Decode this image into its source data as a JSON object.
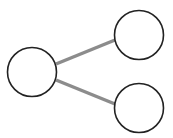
{
  "diagram": {
    "type": "tree",
    "colors": {
      "background": "#ffffff",
      "node_fill": "#ffffff",
      "node_stroke": "#222222",
      "edge": "#8c8c8c"
    },
    "nodes": [
      {
        "id": "root",
        "cx": 32,
        "cy": 72,
        "r": 24.5,
        "label": ""
      },
      {
        "id": "child-top",
        "cx": 139,
        "cy": 35,
        "r": 24.5,
        "label": ""
      },
      {
        "id": "child-bottom",
        "cx": 139,
        "cy": 108,
        "r": 24.5,
        "label": ""
      }
    ],
    "edges": [
      {
        "from": "root",
        "to": "child-top",
        "x1": 56,
        "y1": 64,
        "x2": 115,
        "y2": 40
      },
      {
        "from": "root",
        "to": "child-bottom",
        "x1": 56,
        "y1": 80,
        "x2": 115,
        "y2": 104
      }
    ]
  }
}
